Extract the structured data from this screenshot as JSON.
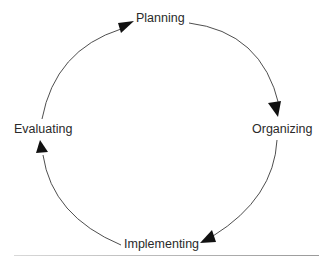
{
  "diagram": {
    "type": "cycle",
    "stages": [
      {
        "id": "planning",
        "label": "Planning"
      },
      {
        "id": "organizing",
        "label": "Organizing"
      },
      {
        "id": "implementing",
        "label": "Implementing"
      },
      {
        "id": "evaluating",
        "label": "Evaluating"
      }
    ],
    "flow": [
      {
        "from": "Planning",
        "to": "Organizing"
      },
      {
        "from": "Organizing",
        "to": "Implementing"
      },
      {
        "from": "Implementing",
        "to": "Evaluating"
      },
      {
        "from": "Evaluating",
        "to": "Planning"
      }
    ],
    "colors": {
      "line": "#3a3a3a",
      "arrowhead": "#111111",
      "text": "#2a2a2a",
      "background": "#ffffff"
    }
  }
}
